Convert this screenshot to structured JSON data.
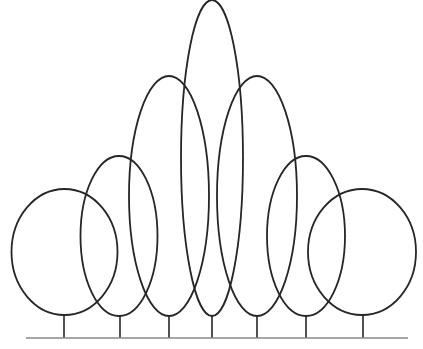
{
  "diagram": {
    "colors": {
      "stroke": "#262626",
      "ground": "#8a8a8a",
      "background": "#ffffff"
    },
    "ground": {
      "x1": 26,
      "x2": 408,
      "y": 338
    },
    "trees": [
      {
        "id": "tree-1",
        "shape": "round",
        "cx": 64.5,
        "cy": 252,
        "rx": 53,
        "ry": 63,
        "trunk_x": 64
      },
      {
        "id": "tree-2",
        "shape": "oval",
        "cx": 119,
        "cy": 236,
        "rx": 38.5,
        "ry": 80,
        "trunk_x": 120
      },
      {
        "id": "tree-3",
        "shape": "tall-oval",
        "cx": 169,
        "cy": 196,
        "rx": 40,
        "ry": 120,
        "trunk_x": 169
      },
      {
        "id": "tree-4",
        "shape": "columnar",
        "cx": 212,
        "cy": 158,
        "rx": 31,
        "ry": 158,
        "trunk_x": 212
      },
      {
        "id": "tree-5",
        "shape": "tall-oval",
        "cx": 257,
        "cy": 196,
        "rx": 40,
        "ry": 120,
        "trunk_x": 257
      },
      {
        "id": "tree-6",
        "shape": "oval",
        "cx": 306,
        "cy": 236,
        "rx": 39,
        "ry": 80,
        "trunk_x": 306
      },
      {
        "id": "tree-7",
        "shape": "round",
        "cx": 362,
        "cy": 252,
        "rx": 54,
        "ry": 63,
        "trunk_x": 363
      }
    ]
  }
}
